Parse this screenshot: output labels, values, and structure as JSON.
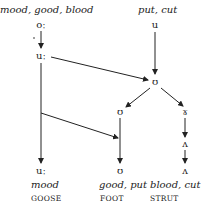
{
  "diagram": {
    "type": "sound-change-flow",
    "top_labels": {
      "left": "mood, good, blood",
      "right": "put, cut"
    },
    "nodes": {
      "o_long": "oː",
      "u_long_1": "uː",
      "u_short_top": "u",
      "upsilon_mid": "ʊ",
      "upsilon_left": "ʊ",
      "gamma_right": "ɤ",
      "wedge_1": "ʌ",
      "u_long_final": "uː",
      "upsilon_final": "ʊ",
      "wedge_final": "ʌ"
    },
    "bottom_examples": {
      "goose": "mood",
      "foot": "good, put",
      "strut": "blood, cut"
    },
    "lexical_sets": {
      "goose": "GOOSE",
      "foot": "FOOT",
      "strut": "STRUT"
    },
    "edges": [
      [
        "oː",
        "uː"
      ],
      [
        "uː",
        "ʊ (mid)"
      ],
      [
        "u",
        "ʊ (mid)"
      ],
      [
        "ʊ (mid)",
        "ʊ (left)"
      ],
      [
        "ʊ (mid)",
        "ɤ"
      ],
      [
        "uː",
        "ʊ (final)"
      ],
      [
        "uː",
        "uː (final)"
      ],
      [
        "ʊ (left)",
        "ʊ (final)"
      ],
      [
        "ɤ",
        "ʌ"
      ],
      [
        "ʌ",
        "ʌ (final)"
      ]
    ],
    "line_color": "#222222"
  }
}
